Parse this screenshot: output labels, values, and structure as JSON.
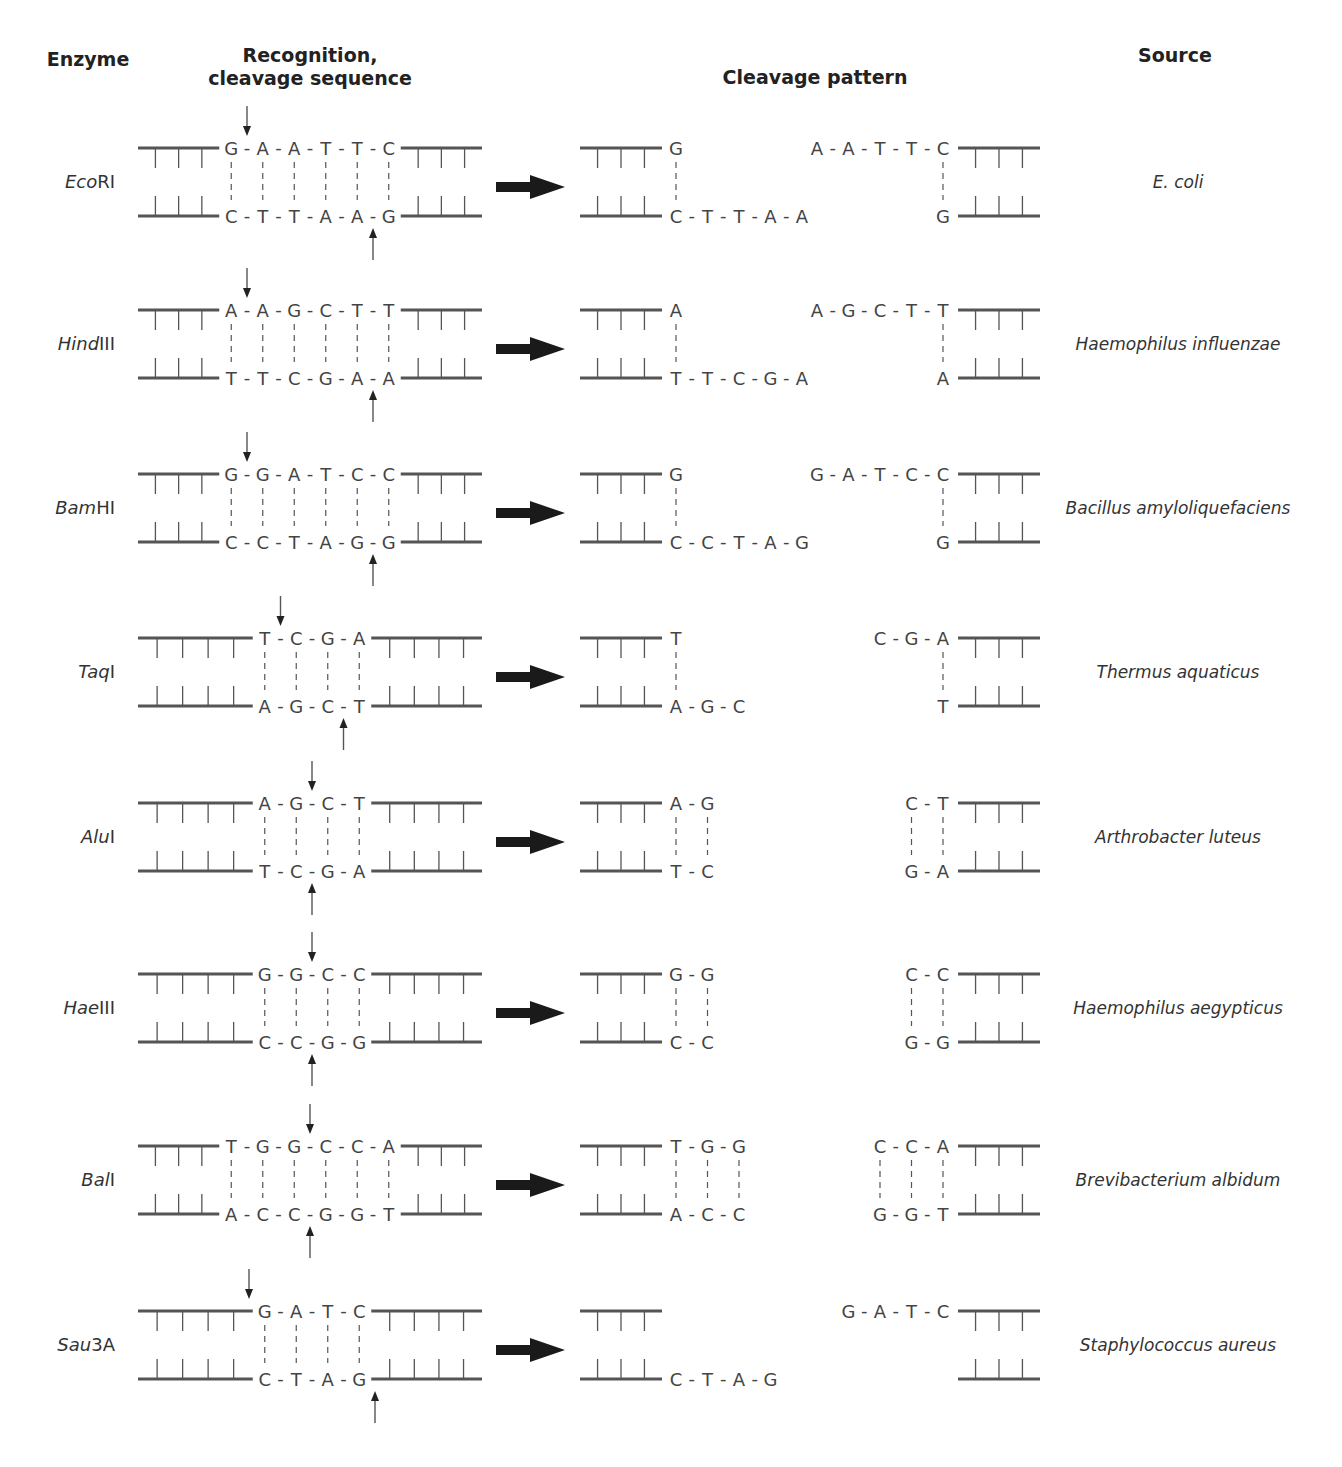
{
  "headers": {
    "enzyme": "Enzyme",
    "recognition_line1": "Recognition,",
    "recognition_line2": "cleavage sequence",
    "cleavage_pattern": "Cleavage pattern",
    "source": "Source"
  },
  "colors": {
    "strand": "#555555",
    "text": "#333333",
    "arrow": "#222222"
  },
  "enzymes": [
    {
      "name_italic": "Eco",
      "name_roman": "RI",
      "top": "GAATTC",
      "bottom": "CTTAAG",
      "cut_top": 1,
      "cut_bottom": 5,
      "flank": 3,
      "left_top": "G",
      "left_bottom": "CTTAA",
      "right_top": "AATTC",
      "right_bottom": "G",
      "source": "E. coli"
    },
    {
      "name_italic": "Hind",
      "name_roman": "III",
      "top": "AAGCTT",
      "bottom": "TTCGAA",
      "cut_top": 1,
      "cut_bottom": 5,
      "flank": 3,
      "left_top": "A",
      "left_bottom": "TTCGA",
      "right_top": "AGCTT",
      "right_bottom": "A",
      "source": "Haemophilus influenzae"
    },
    {
      "name_italic": "Bam",
      "name_roman": "HI",
      "top": "GGATCC",
      "bottom": "CCTAGG",
      "cut_top": 1,
      "cut_bottom": 5,
      "flank": 3,
      "left_top": "G",
      "left_bottom": "CCTAG",
      "right_top": "GATCC",
      "right_bottom": "G",
      "source": "Bacillus amyloliquefaciens"
    },
    {
      "name_italic": "Taq",
      "name_roman": "I",
      "top": "TCGA",
      "bottom": "AGCT",
      "cut_top": 1,
      "cut_bottom": 3,
      "flank": 4,
      "left_top": "T",
      "left_bottom": "AGC",
      "right_top": "CGA",
      "right_bottom": "T",
      "source": "Thermus aquaticus"
    },
    {
      "name_italic": "Alu",
      "name_roman": "I",
      "top": "AGCT",
      "bottom": "TCGA",
      "cut_top": 2,
      "cut_bottom": 2,
      "flank": 4,
      "left_top": "AG",
      "left_bottom": "TC",
      "right_top": "CT",
      "right_bottom": "GA",
      "source": "Arthrobacter luteus"
    },
    {
      "name_italic": "Hae",
      "name_roman": "III",
      "top": "GGCC",
      "bottom": "CCGG",
      "cut_top": 2,
      "cut_bottom": 2,
      "flank": 4,
      "left_top": "GG",
      "left_bottom": "CC",
      "right_top": "CC",
      "right_bottom": "GG",
      "source": "Haemophilus aegypticus"
    },
    {
      "name_italic": "Bal",
      "name_roman": "I",
      "top": "TGGCCA",
      "bottom": "ACCGGT",
      "cut_top": 3,
      "cut_bottom": 3,
      "flank": 3,
      "left_top": "TGG",
      "left_bottom": "ACC",
      "right_top": "CCA",
      "right_bottom": "GGT",
      "source": "Brevibacterium albidum"
    },
    {
      "name_italic": "Sau",
      "name_roman": "3A",
      "top": "GATC",
      "bottom": "CTAG",
      "cut_top": 0,
      "cut_bottom": 4,
      "flank": 4,
      "left_top": "",
      "left_bottom": "CTAG",
      "right_top": "GATC",
      "right_bottom": "",
      "source": "Staphylococcus aureus"
    }
  ]
}
